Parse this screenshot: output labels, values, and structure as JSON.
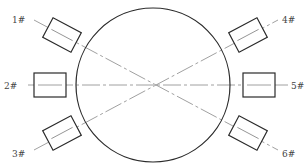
{
  "diagram": {
    "type": "sensor-layout",
    "circle": {
      "cx": 153,
      "cy": 85,
      "r": 77
    },
    "colors": {
      "stroke": "#2a2a2a",
      "line": "#888888",
      "label": "#444444",
      "background": "#ffffff"
    },
    "sensors": [
      {
        "id": "1#",
        "label": "1#",
        "cx": 62,
        "cy": 35,
        "angle": 28,
        "label_x": 12,
        "label_y": 20
      },
      {
        "id": "2#",
        "label": "2#",
        "cx": 50,
        "cy": 85,
        "angle": 0,
        "label_x": 4,
        "label_y": 89
      },
      {
        "id": "3#",
        "label": "3#",
        "cx": 62,
        "cy": 133,
        "angle": -28,
        "label_x": 12,
        "label_y": 155
      },
      {
        "id": "4#",
        "label": "4#",
        "cx": 248,
        "cy": 35,
        "angle": -28,
        "label_x": 282,
        "label_y": 23
      },
      {
        "id": "5#",
        "label": "5#",
        "cx": 259,
        "cy": 85,
        "angle": 0,
        "label_x": 291,
        "label_y": 89
      },
      {
        "id": "6#",
        "label": "6#",
        "cx": 248,
        "cy": 133,
        "angle": 28,
        "label_x": 282,
        "label_y": 153
      }
    ],
    "paths": [
      {
        "from": "1#",
        "to": "6#"
      },
      {
        "from": "2#",
        "to": "5#"
      },
      {
        "from": "3#",
        "to": "4#"
      }
    ]
  }
}
